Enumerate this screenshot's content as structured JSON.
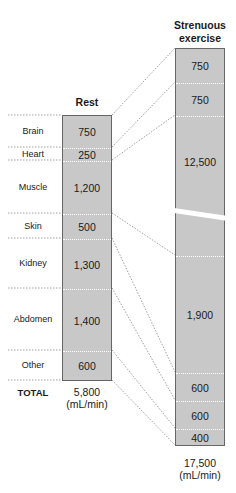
{
  "headers": {
    "rest": "Rest",
    "exercise_line1": "Strenuous",
    "exercise_line2": "exercise"
  },
  "rest": {
    "rows": [
      {
        "organ": "Brain",
        "value": "750"
      },
      {
        "organ": "Heart",
        "value": "250"
      },
      {
        "organ": "Muscle",
        "value": "1,200"
      },
      {
        "organ": "Skin",
        "value": "500"
      },
      {
        "organ": "Kidney",
        "value": "1,300"
      },
      {
        "organ": "Abdomen",
        "value": "1,400"
      },
      {
        "organ": "Other",
        "value": "600"
      }
    ],
    "total_label": "TOTAL",
    "total_value": "5,800",
    "total_unit": "(mL/min)"
  },
  "exercise": {
    "segments": [
      {
        "organ": "Brain",
        "value": "750"
      },
      {
        "organ": "Heart",
        "value": "750"
      },
      {
        "organ": "Muscle",
        "value": "12,500"
      },
      {
        "organ": "Skin",
        "value": "1,900"
      },
      {
        "organ": "Kidney",
        "value": "600"
      },
      {
        "organ": "Abdomen",
        "value": "600"
      },
      {
        "organ": "Other",
        "value": "400"
      }
    ],
    "total_value": "17,500",
    "total_unit": "(mL/min)"
  },
  "colors": {
    "bar_fill": "#c8c8c8",
    "bar_border": "#666666",
    "connector": "#777777"
  }
}
